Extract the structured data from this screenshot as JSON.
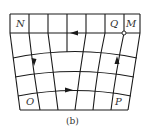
{
  "figure": {
    "caption": "(b)",
    "labels": {
      "N": "N",
      "Q": "Q",
      "M": "M",
      "O": "O",
      "P": "P"
    }
  }
}
